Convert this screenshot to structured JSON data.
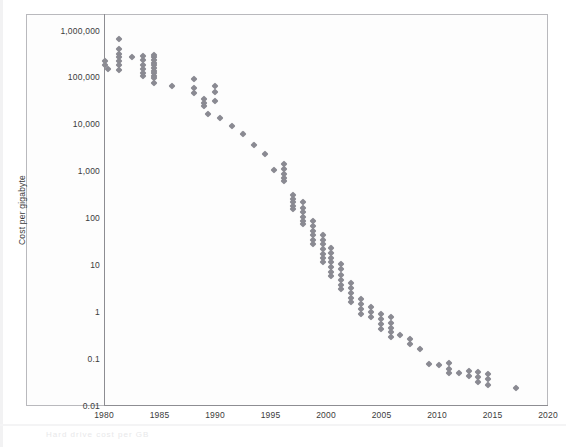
{
  "figure": {
    "background_color": "#ffffff",
    "frame_color": "#b9b9bd",
    "marker_color": "#8a8a92",
    "caption_text": "Hard drive cost per GB"
  },
  "axes": {
    "y_title": "Cost per gigabyte",
    "y_tick_labels": [
      "1,000,000",
      "100,000",
      "10,000",
      "1,000",
      "100",
      "10",
      "1",
      "0.1",
      "0.01"
    ],
    "x_tick_labels": [
      "1980",
      "1985",
      "1990",
      "1995",
      "2000",
      "2005",
      "2010",
      "2015",
      "2020"
    ]
  },
  "chart_data": {
    "type": "scatter",
    "title": "",
    "xlabel": "",
    "ylabel": "Cost per gigabyte",
    "xlim": [
      1980,
      2020
    ],
    "ylim": [
      0.01,
      1000000
    ],
    "yscale": "log",
    "grid": false,
    "legend": null,
    "series": [
      {
        "name": "Cost per gigabyte",
        "marker": "diamond",
        "color": "#8a8a92",
        "points": [
          {
            "x": 1980.0,
            "y": 230000
          },
          {
            "x": 1980.0,
            "y": 190000
          },
          {
            "x": 1980.3,
            "y": 160000
          },
          {
            "x": 1981.3,
            "y": 700000
          },
          {
            "x": 1981.3,
            "y": 420000
          },
          {
            "x": 1981.3,
            "y": 330000
          },
          {
            "x": 1981.3,
            "y": 280000
          },
          {
            "x": 1981.3,
            "y": 240000
          },
          {
            "x": 1981.3,
            "y": 190000
          },
          {
            "x": 1981.3,
            "y": 150000
          },
          {
            "x": 1982.4,
            "y": 290000
          },
          {
            "x": 1983.4,
            "y": 300000
          },
          {
            "x": 1983.4,
            "y": 250000
          },
          {
            "x": 1983.4,
            "y": 195000
          },
          {
            "x": 1983.4,
            "y": 160000
          },
          {
            "x": 1983.4,
            "y": 130000
          },
          {
            "x": 1983.4,
            "y": 110000
          },
          {
            "x": 1984.4,
            "y": 320000
          },
          {
            "x": 1984.4,
            "y": 280000
          },
          {
            "x": 1984.4,
            "y": 245000
          },
          {
            "x": 1984.4,
            "y": 215000
          },
          {
            "x": 1984.4,
            "y": 190000
          },
          {
            "x": 1984.4,
            "y": 165000
          },
          {
            "x": 1984.4,
            "y": 145000
          },
          {
            "x": 1984.4,
            "y": 128000
          },
          {
            "x": 1984.4,
            "y": 112000
          },
          {
            "x": 1984.4,
            "y": 100000
          },
          {
            "x": 1984.4,
            "y": 80000
          },
          {
            "x": 1986.0,
            "y": 70000
          },
          {
            "x": 1988.0,
            "y": 95000
          },
          {
            "x": 1988.0,
            "y": 62000
          },
          {
            "x": 1988.0,
            "y": 48000
          },
          {
            "x": 1988.9,
            "y": 36000
          },
          {
            "x": 1988.9,
            "y": 30000
          },
          {
            "x": 1988.9,
            "y": 26000
          },
          {
            "x": 1989.9,
            "y": 70000
          },
          {
            "x": 1989.9,
            "y": 50000
          },
          {
            "x": 1989.9,
            "y": 33000
          },
          {
            "x": 1989.3,
            "y": 17000
          },
          {
            "x": 1990.4,
            "y": 14000
          },
          {
            "x": 1991.4,
            "y": 9500
          },
          {
            "x": 1992.4,
            "y": 6500
          },
          {
            "x": 1993.4,
            "y": 3800
          },
          {
            "x": 1994.4,
            "y": 2400
          },
          {
            "x": 1995.2,
            "y": 1100
          },
          {
            "x": 1996.1,
            "y": 1500
          },
          {
            "x": 1996.1,
            "y": 1150
          },
          {
            "x": 1996.1,
            "y": 900
          },
          {
            "x": 1996.1,
            "y": 760
          },
          {
            "x": 1996.1,
            "y": 640
          },
          {
            "x": 1996.9,
            "y": 330
          },
          {
            "x": 1996.9,
            "y": 270
          },
          {
            "x": 1996.9,
            "y": 225
          },
          {
            "x": 1996.9,
            "y": 190
          },
          {
            "x": 1996.9,
            "y": 160
          },
          {
            "x": 1997.8,
            "y": 230
          },
          {
            "x": 1997.8,
            "y": 175
          },
          {
            "x": 1997.8,
            "y": 140
          },
          {
            "x": 1997.8,
            "y": 112
          },
          {
            "x": 1997.8,
            "y": 92
          },
          {
            "x": 1997.8,
            "y": 78
          },
          {
            "x": 1998.7,
            "y": 90
          },
          {
            "x": 1998.7,
            "y": 70
          },
          {
            "x": 1998.7,
            "y": 56
          },
          {
            "x": 1998.7,
            "y": 45
          },
          {
            "x": 1998.7,
            "y": 36
          },
          {
            "x": 1998.7,
            "y": 30
          },
          {
            "x": 1999.6,
            "y": 45
          },
          {
            "x": 1999.6,
            "y": 36
          },
          {
            "x": 1999.6,
            "y": 29
          },
          {
            "x": 1999.6,
            "y": 23
          },
          {
            "x": 1999.6,
            "y": 18
          },
          {
            "x": 1999.6,
            "y": 15
          },
          {
            "x": 1999.6,
            "y": 12
          },
          {
            "x": 2000.4,
            "y": 24
          },
          {
            "x": 2000.4,
            "y": 19
          },
          {
            "x": 2000.4,
            "y": 15
          },
          {
            "x": 2000.4,
            "y": 12
          },
          {
            "x": 2000.4,
            "y": 9.5
          },
          {
            "x": 2000.4,
            "y": 7.5
          },
          {
            "x": 2000.4,
            "y": 6.0
          },
          {
            "x": 2001.3,
            "y": 11
          },
          {
            "x": 2001.3,
            "y": 8.5
          },
          {
            "x": 2001.3,
            "y": 6.5
          },
          {
            "x": 2001.3,
            "y": 5.0
          },
          {
            "x": 2001.3,
            "y": 4.0
          },
          {
            "x": 2001.3,
            "y": 3.2
          },
          {
            "x": 2002.2,
            "y": 4.4
          },
          {
            "x": 2002.2,
            "y": 3.4
          },
          {
            "x": 2002.2,
            "y": 2.7
          },
          {
            "x": 2002.2,
            "y": 2.1
          },
          {
            "x": 2002.2,
            "y": 1.7
          },
          {
            "x": 2003.1,
            "y": 2.0
          },
          {
            "x": 2003.1,
            "y": 1.55
          },
          {
            "x": 2003.1,
            "y": 1.2
          },
          {
            "x": 2003.1,
            "y": 0.95
          },
          {
            "x": 2004.0,
            "y": 1.35
          },
          {
            "x": 2004.0,
            "y": 1.05
          },
          {
            "x": 2004.0,
            "y": 0.8
          },
          {
            "x": 2004.9,
            "y": 0.95
          },
          {
            "x": 2004.9,
            "y": 0.72
          },
          {
            "x": 2004.9,
            "y": 0.58
          },
          {
            "x": 2004.9,
            "y": 0.46
          },
          {
            "x": 2005.8,
            "y": 0.8
          },
          {
            "x": 2005.8,
            "y": 0.6
          },
          {
            "x": 2005.8,
            "y": 0.47
          },
          {
            "x": 2005.8,
            "y": 0.38
          },
          {
            "x": 2005.8,
            "y": 0.3
          },
          {
            "x": 2006.6,
            "y": 0.33
          },
          {
            "x": 2007.5,
            "y": 0.28
          },
          {
            "x": 2007.5,
            "y": 0.22
          },
          {
            "x": 2008.4,
            "y": 0.17
          },
          {
            "x": 2009.2,
            "y": 0.082
          },
          {
            "x": 2010.1,
            "y": 0.075
          },
          {
            "x": 2011.0,
            "y": 0.084
          },
          {
            "x": 2011.0,
            "y": 0.064
          },
          {
            "x": 2011.0,
            "y": 0.051
          },
          {
            "x": 2011.9,
            "y": 0.052
          },
          {
            "x": 2012.8,
            "y": 0.058
          },
          {
            "x": 2012.8,
            "y": 0.044
          },
          {
            "x": 2013.6,
            "y": 0.055
          },
          {
            "x": 2013.6,
            "y": 0.042
          },
          {
            "x": 2013.6,
            "y": 0.034
          },
          {
            "x": 2014.5,
            "y": 0.05
          },
          {
            "x": 2014.5,
            "y": 0.038
          },
          {
            "x": 2014.5,
            "y": 0.029
          },
          {
            "x": 2017.0,
            "y": 0.025
          }
        ]
      }
    ]
  }
}
